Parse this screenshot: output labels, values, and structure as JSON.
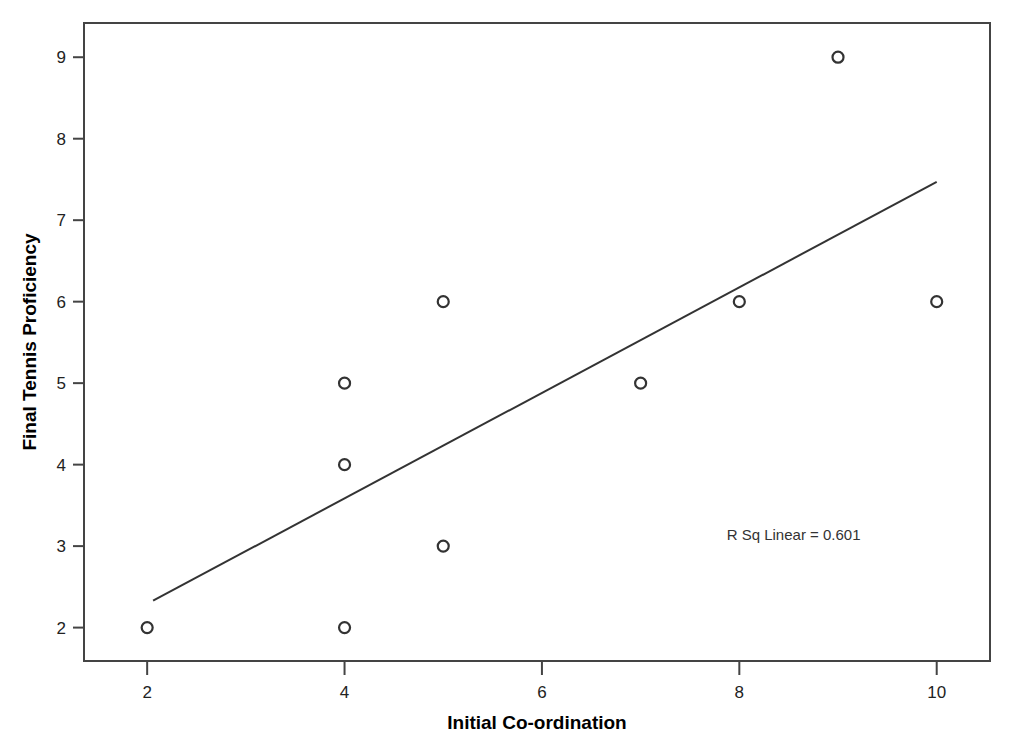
{
  "chart_data": {
    "type": "scatter",
    "title": "",
    "xlabel": "Initial Co-ordination",
    "ylabel": "Final Tennis Proficiency",
    "xlim": [
      1.36,
      10.54
    ],
    "ylim": [
      1.59,
      9.42
    ],
    "xticks": [
      "2",
      "4",
      "6",
      "8",
      "10"
    ],
    "xtick_values": [
      2,
      4,
      6,
      8,
      10
    ],
    "yticks": [
      "2",
      "3",
      "4",
      "5",
      "6",
      "7",
      "8",
      "9"
    ],
    "ytick_values": [
      2,
      3,
      4,
      5,
      6,
      7,
      8,
      9
    ],
    "grid": false,
    "legend": "none",
    "x": [
      2,
      4,
      4,
      4,
      5,
      5,
      7,
      8,
      9,
      10
    ],
    "y": [
      2,
      2,
      4,
      5,
      3,
      6,
      5,
      6,
      9,
      6
    ],
    "points": [
      {
        "x": 2,
        "y": 2
      },
      {
        "x": 4,
        "y": 2
      },
      {
        "x": 4,
        "y": 4
      },
      {
        "x": 4,
        "y": 5
      },
      {
        "x": 5,
        "y": 3
      },
      {
        "x": 5,
        "y": 6
      },
      {
        "x": 7,
        "y": 5
      },
      {
        "x": 8,
        "y": 6
      },
      {
        "x": 9,
        "y": 9
      },
      {
        "x": 10,
        "y": 6
      }
    ],
    "marker": {
      "shape": "open-circle",
      "size": 11,
      "edge_color": "#333333",
      "fill_color": "none"
    },
    "fit_line": {
      "type": "linear",
      "color": "#333333",
      "x_start": 2.06,
      "y_start": 2.33,
      "x_end": 10.0,
      "y_end": 7.47
    },
    "annotations": [
      {
        "name": "r-squared-label",
        "text": "R Sq Linear = 0.601",
        "x": 8.55,
        "y": 3.08
      }
    ],
    "r_squared": "0.601",
    "frame_color": "#444444"
  },
  "axes": {
    "x_axis_label": "Initial Co-ordination",
    "y_axis_label": "Final Tennis Proficiency"
  }
}
